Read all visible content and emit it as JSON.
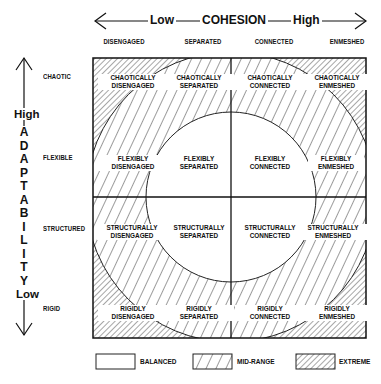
{
  "diagram": {
    "type": "circumplex-grid",
    "x_axis": {
      "title": "COHESION",
      "low_label": "Low",
      "high_label": "High",
      "levels": [
        "DISENGAGED",
        "SEPARATED",
        "CONNECTED",
        "ENMESHED"
      ]
    },
    "y_axis": {
      "title_letters": [
        "A",
        "D",
        "A",
        "P",
        "T",
        "A",
        "B",
        "I",
        "L",
        "I",
        "T",
        "Y"
      ],
      "title": "ADAPTABILITY",
      "high_label": "High",
      "low_label": "Low",
      "levels": [
        "CHAOTIC",
        "FLEXIBLE",
        "STRUCTURED",
        "RIGID"
      ]
    },
    "cells": [
      [
        [
          "CHAOTICALLY",
          "DISENGAGED"
        ],
        [
          "CHAOTICALLY",
          "SEPARATED"
        ],
        [
          "CHAOTICALLY",
          "CONNECTED"
        ],
        [
          "CHAOTICALLY",
          "ENMESHED"
        ]
      ],
      [
        [
          "FLEXIBLY",
          "DISENGAGED"
        ],
        [
          "FLEXIBLY",
          "SEPARATED"
        ],
        [
          "FLEXIBLY",
          "CONNECTED"
        ],
        [
          "FLEXIBLY",
          "ENMESHED"
        ]
      ],
      [
        [
          "STRUCTURALLY",
          "DISENGAGED"
        ],
        [
          "STRUCTURALLY",
          "SEPARATED"
        ],
        [
          "STRUCTURALLY",
          "CONNECTED"
        ],
        [
          "STRUCTURALLY",
          "ENMESHED"
        ]
      ],
      [
        [
          "RIGIDLY",
          "DISENGAGED"
        ],
        [
          "RIGIDLY",
          "SEPARATED"
        ],
        [
          "RIGIDLY",
          "CONNECTED"
        ],
        [
          "RIGIDLY",
          "ENMESHED"
        ]
      ]
    ],
    "regions": {
      "inner": "BALANCED",
      "middle": "MID-RANGE",
      "outer": "EXTREME"
    },
    "legend": [
      {
        "label": "BALANCED",
        "pattern": "blank"
      },
      {
        "label": "MID-RANGE",
        "pattern": "wide-forward-hatch"
      },
      {
        "label": "EXTREME",
        "pattern": "dense-back-hatch"
      }
    ],
    "colors": {
      "line": "#1a1a1a",
      "background": "#ffffff"
    }
  }
}
